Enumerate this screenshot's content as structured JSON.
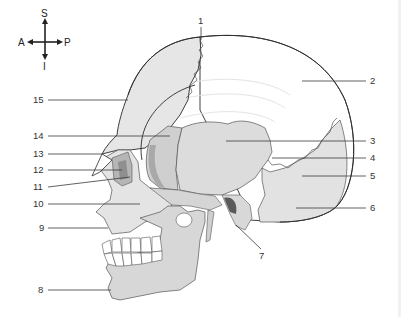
{
  "diagram": {
    "type": "anatomical-diagram",
    "orientation_compass": {
      "superior": "S",
      "inferior": "I",
      "anterior": "A",
      "posterior": "P"
    },
    "labels": [
      {
        "id": "1",
        "text": "1",
        "x": 201,
        "y": 24,
        "line": [
          201,
          27,
          201,
          40
        ]
      },
      {
        "id": "2",
        "text": "2",
        "x": 372,
        "y": 84,
        "line": [
          302,
          81,
          366,
          81
        ]
      },
      {
        "id": "3",
        "text": "3",
        "x": 372,
        "y": 143,
        "line": [
          226,
          141,
          366,
          141
        ]
      },
      {
        "id": "4",
        "text": "4",
        "x": 372,
        "y": 160,
        "line": [
          272,
          158,
          366,
          158
        ]
      },
      {
        "id": "5",
        "text": "5",
        "x": 372,
        "y": 178,
        "line": [
          302,
          176,
          366,
          176
        ]
      },
      {
        "id": "6",
        "text": "6",
        "x": 372,
        "y": 210,
        "line": [
          296,
          208,
          366,
          208
        ]
      },
      {
        "id": "7",
        "text": "7",
        "x": 259,
        "y": 258,
        "line": [
          236,
          225,
          261,
          250
        ]
      },
      {
        "id": "8",
        "text": "8",
        "x": 38,
        "y": 293,
        "line": [
          48,
          290,
          111,
          290
        ]
      },
      {
        "id": "9",
        "text": "9",
        "x": 39,
        "y": 231,
        "line": [
          48,
          228,
          108,
          228
        ]
      },
      {
        "id": "10",
        "text": "10",
        "x": 33,
        "y": 207,
        "line": [
          48,
          204,
          140,
          204
        ]
      },
      {
        "id": "11",
        "text": "11",
        "x": 33,
        "y": 189,
        "line": [
          48,
          187,
          130,
          177
        ]
      },
      {
        "id": "12",
        "text": "12",
        "x": 33,
        "y": 173,
        "line": [
          48,
          170,
          122,
          170
        ]
      },
      {
        "id": "13",
        "text": "13",
        "x": 33,
        "y": 157,
        "line": [
          48,
          154,
          102,
          154
        ]
      },
      {
        "id": "14",
        "text": "14",
        "x": 33,
        "y": 138,
        "line": [
          48,
          136,
          170,
          136
        ]
      },
      {
        "id": "15",
        "text": "15",
        "x": 33,
        "y": 102,
        "line": [
          48,
          100,
          128,
          100
        ]
      }
    ],
    "colors": {
      "bone_light": "#e6e6e6",
      "bone_mid": "#d4d4d4",
      "bone_dark": "#bdbdbd",
      "bone_shadow": "#9e9e9e",
      "cranium_white": "#ffffff",
      "outline": "#2a2a2a",
      "label_text": "#333333"
    }
  }
}
